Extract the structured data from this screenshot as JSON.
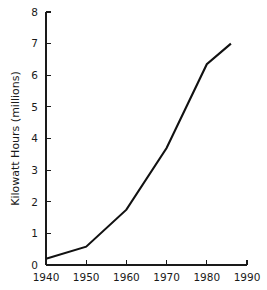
{
  "chart_data": {
    "type": "line",
    "title": "",
    "subtitle": "",
    "xlabel": "",
    "ylabel": "Kilowatt Hours (millions)",
    "xlim": [
      1940,
      1990
    ],
    "ylim": [
      0,
      8
    ],
    "grid": false,
    "legend": null,
    "x_ticks": [
      1940,
      1950,
      1960,
      1970,
      1980,
      1990
    ],
    "x_tick_labels": [
      "1940",
      "1950",
      "1960",
      "1970",
      "1980",
      "1990"
    ],
    "y_ticks": [
      0,
      1,
      2,
      3,
      4,
      5,
      6,
      7,
      8
    ],
    "y_tick_labels": [
      "0",
      "1",
      "2",
      "3",
      "4",
      "5",
      "6",
      "7",
      "8"
    ],
    "series": [
      {
        "name": "Kilowatt Hours",
        "color": "#111111",
        "x": [
          1940,
          1950,
          1960,
          1970,
          1980,
          1986
        ],
        "values": [
          0.2,
          0.58,
          1.75,
          3.7,
          6.35,
          7.0
        ]
      }
    ]
  },
  "axes": {
    "y_axis_title": "Kilowatt Hours (millions)"
  },
  "colors": {
    "line": "#111111",
    "axis": "#1a1a1a",
    "background": "#ffffff"
  }
}
